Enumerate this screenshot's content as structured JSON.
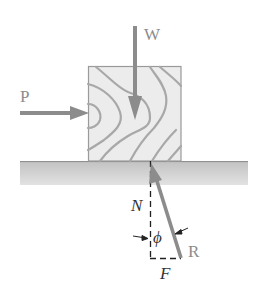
{
  "diagram": {
    "type": "free-body diagram",
    "colors": {
      "background": "#ffffff",
      "block_fill": "#ececec",
      "block_border": "#9a9a9a",
      "wood_grain": "#a8a8a8",
      "ground_top": "#b8b8b8",
      "ground_bottom": "#dcdcdc",
      "force_arrow": "#8c8c8c",
      "construction_lines": "#222222",
      "label_force": "#8c8c8c",
      "label_component": "#333333"
    },
    "labels": {
      "weight": "W",
      "push": "P",
      "normal": "N",
      "friction": "F",
      "resultant": "R",
      "angle": "ϕ"
    },
    "elements": {
      "block": {
        "x": 88,
        "y": 66,
        "width": 93,
        "height": 95
      },
      "ground": {
        "x": 20,
        "y": 161,
        "width": 228,
        "height": 24
      },
      "force_W": {
        "direction": "down",
        "from": [
          135,
          26
        ],
        "to": [
          135,
          118
        ]
      },
      "force_P": {
        "direction": "right",
        "from": [
          20,
          113
        ],
        "to": [
          88,
          113
        ]
      },
      "force_R": {
        "direction": "up-left",
        "from": [
          181,
          258
        ],
        "to": [
          152,
          163
        ]
      },
      "component_N": {
        "style": "dashed",
        "from": [
          150,
          161
        ],
        "to": [
          150,
          258
        ]
      },
      "component_F": {
        "style": "dashed",
        "from": [
          150,
          258
        ],
        "to": [
          181,
          258
        ]
      }
    }
  }
}
